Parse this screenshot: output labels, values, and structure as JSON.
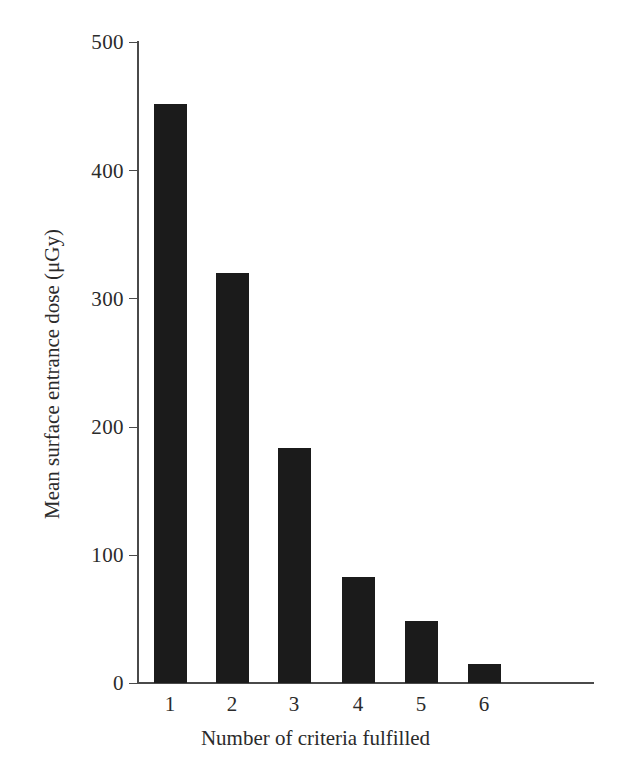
{
  "chart_data": {
    "type": "bar",
    "title": "",
    "subtitle": "",
    "xlabel": "Number of criteria fulfilled",
    "ylabel": "Mean surface entrance dose (μGy)",
    "categories": [
      "1",
      "2",
      "3",
      "4",
      "5",
      "6"
    ],
    "values": [
      452,
      320,
      183,
      83,
      48,
      15
    ],
    "series": [
      {
        "name": "Mean surface entrance dose",
        "values": [
          452,
          320,
          183,
          83,
          48,
          15
        ]
      }
    ],
    "ylim": [
      0,
      500
    ],
    "ytick_labels": [
      "0",
      "100",
      "200",
      "300",
      "400",
      "500"
    ],
    "ytick_values": [
      0,
      100,
      200,
      300,
      400,
      500
    ],
    "xtick_labels": [
      "1",
      "2",
      "3",
      "4",
      "5",
      "6"
    ],
    "grid": false,
    "legend": false,
    "legend_position": "none",
    "bar_color": "#1b1b1b",
    "axis_color": "#4a4a4a",
    "background_color": "#ffffff"
  }
}
